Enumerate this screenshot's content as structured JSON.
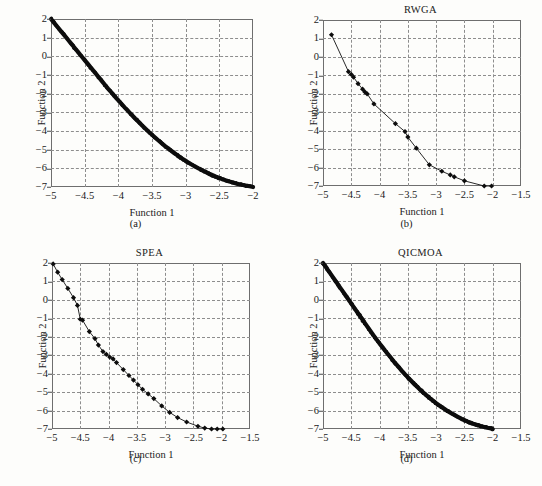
{
  "figure": {
    "panel_count": 4,
    "axis_label_x": "Function 1",
    "axis_label_y": "Function 2"
  },
  "chart_data": [
    {
      "type": "scatter",
      "panel": "a",
      "caption": "(a)",
      "title": "",
      "xlabel": "Function 1",
      "ylabel": "Function 2",
      "xlim": [
        -5,
        -2
      ],
      "ylim": [
        -7,
        2
      ],
      "xticks": [
        -5,
        -4.5,
        -4,
        -3.5,
        -3,
        -2.5,
        -2
      ],
      "xticklabels": [
        "−5",
        "−4.5",
        "−4",
        "−3.5",
        "−3",
        "−2.5",
        "−2"
      ],
      "yticks": [
        2,
        1,
        0,
        -1,
        -2,
        -3,
        -4,
        -5,
        -6,
        -7
      ],
      "yticklabels": [
        "2",
        "1",
        "0",
        "−1",
        "−2",
        "−3",
        "−4",
        "−5",
        "−6",
        "−7"
      ],
      "grid": true,
      "marker": "dense-dot-band",
      "legend": null,
      "x": [
        -5.0,
        -4.95,
        -4.9,
        -4.85,
        -4.8,
        -4.75,
        -4.7,
        -4.65,
        -4.6,
        -4.55,
        -4.5,
        -4.45,
        -4.4,
        -4.35,
        -4.3,
        -4.25,
        -4.2,
        -4.15,
        -4.1,
        -4.05,
        -4.0,
        -3.95,
        -3.9,
        -3.85,
        -3.8,
        -3.75,
        -3.7,
        -3.65,
        -3.6,
        -3.55,
        -3.5,
        -3.45,
        -3.4,
        -3.35,
        -3.3,
        -3.25,
        -3.2,
        -3.15,
        -3.1,
        -3.05,
        -3.0,
        -2.95,
        -2.9,
        -2.85,
        -2.8,
        -2.75,
        -2.7,
        -2.65,
        -2.6,
        -2.55,
        -2.5,
        -2.45,
        -2.4,
        -2.35,
        -2.3,
        -2.25,
        -2.2,
        -2.15,
        -2.1,
        -2.05,
        -2.0
      ],
      "y": [
        2.0,
        1.78,
        1.56,
        1.34,
        1.12,
        0.9,
        0.68,
        0.46,
        0.24,
        0.02,
        -0.2,
        -0.42,
        -0.64,
        -0.86,
        -1.08,
        -1.3,
        -1.52,
        -1.74,
        -1.95,
        -2.16,
        -2.36,
        -2.56,
        -2.76,
        -2.95,
        -3.14,
        -3.33,
        -3.51,
        -3.69,
        -3.87,
        -4.04,
        -4.2,
        -4.36,
        -4.52,
        -4.67,
        -4.82,
        -4.96,
        -5.1,
        -5.23,
        -5.36,
        -5.48,
        -5.6,
        -5.71,
        -5.82,
        -5.92,
        -6.02,
        -6.11,
        -6.2,
        -6.29,
        -6.37,
        -6.45,
        -6.52,
        -6.59,
        -6.65,
        -6.71,
        -6.76,
        -6.81,
        -6.85,
        -6.89,
        -6.93,
        -6.96,
        -7.0
      ]
    },
    {
      "type": "scatter",
      "panel": "b",
      "caption": "(b)",
      "title": "RWGA",
      "xlabel": "Function 1",
      "ylabel": "Function 2",
      "xlim": [
        -5,
        -1.5
      ],
      "ylim": [
        -7,
        2
      ],
      "xticks": [
        -5,
        -4.5,
        -4,
        -3.5,
        -3,
        -2.5,
        -2,
        -1.5
      ],
      "xticklabels": [
        "−5",
        "−4.5",
        "−4",
        "−3.5",
        "−3",
        "−2.5",
        "−2",
        "−1.5"
      ],
      "yticks": [
        2,
        1,
        0,
        -1,
        -2,
        -3,
        -4,
        -5,
        -6,
        -7
      ],
      "yticklabels": [
        "2",
        "1",
        "0",
        "−1",
        "−2",
        "−3",
        "−4",
        "−5",
        "−6",
        "−7"
      ],
      "grid": true,
      "marker": "diamond",
      "legend": null,
      "x": [
        -4.85,
        -4.55,
        -4.5,
        -4.46,
        -4.38,
        -4.3,
        -4.26,
        -4.22,
        -4.1,
        -3.72,
        -3.55,
        -3.5,
        -3.35,
        -3.12,
        -2.9,
        -2.75,
        -2.68,
        -2.5,
        -2.15,
        -2.02
      ],
      "y": [
        1.2,
        -0.8,
        -0.95,
        -1.1,
        -1.45,
        -1.75,
        -1.9,
        -2.0,
        -2.55,
        -3.62,
        -4.05,
        -4.35,
        -4.95,
        -5.85,
        -6.2,
        -6.4,
        -6.5,
        -6.72,
        -7.0,
        -7.0
      ]
    },
    {
      "type": "scatter",
      "panel": "c",
      "caption": "(c)",
      "title": "SPEA",
      "xlabel": "Function 1",
      "ylabel": "Function 2",
      "xlim": [
        -5,
        -1.5
      ],
      "ylim": [
        -7,
        2
      ],
      "xticks": [
        -5,
        -4.5,
        -4,
        -3.5,
        -3,
        -2.5,
        -2,
        -1.5
      ],
      "xticklabels": [
        "−5",
        "−4.5",
        "−4",
        "−3.5",
        "−3",
        "−2.5",
        "−2",
        "−1.5"
      ],
      "yticks": [
        2,
        1,
        0,
        -1,
        -2,
        -3,
        -4,
        -5,
        -6,
        -7
      ],
      "yticklabels": [
        "2",
        "1",
        "0",
        "−1",
        "−2",
        "−3",
        "−4",
        "−5",
        "−6",
        "−7"
      ],
      "grid": true,
      "marker": "diamond",
      "legend": null,
      "x": [
        -4.98,
        -4.9,
        -4.82,
        -4.72,
        -4.62,
        -4.55,
        -4.5,
        -4.46,
        -4.34,
        -4.24,
        -4.18,
        -4.1,
        -4.04,
        -3.98,
        -3.92,
        -3.86,
        -3.74,
        -3.64,
        -3.56,
        -3.48,
        -3.4,
        -3.3,
        -3.2,
        -3.06,
        -2.92,
        -2.78,
        -2.62,
        -2.42,
        -2.3,
        -2.18,
        -2.08,
        -1.98
      ],
      "y": [
        1.95,
        1.5,
        1.1,
        0.62,
        0.12,
        -0.3,
        -1.05,
        -1.1,
        -1.72,
        -2.1,
        -2.45,
        -2.8,
        -2.95,
        -3.1,
        -3.2,
        -3.4,
        -3.78,
        -4.1,
        -4.35,
        -4.6,
        -4.85,
        -5.1,
        -5.35,
        -5.75,
        -6.1,
        -6.38,
        -6.62,
        -6.85,
        -6.95,
        -7.0,
        -7.0,
        -7.0
      ]
    },
    {
      "type": "scatter",
      "panel": "d",
      "caption": "(d)",
      "title": "QICMOA",
      "xlabel": "Function 1",
      "ylabel": "Function 2",
      "xlim": [
        -5,
        -1.5
      ],
      "ylim": [
        -7,
        2
      ],
      "xticks": [
        -5,
        -4.5,
        -4,
        -3.5,
        -3,
        -2.5,
        -2,
        -1.5
      ],
      "xticklabels": [
        "−5",
        "−4.5",
        "−4",
        "−3.5",
        "−3",
        "−2.5",
        "−2",
        "−1.5"
      ],
      "yticks": [
        2,
        1,
        0,
        -1,
        -2,
        -3,
        -4,
        -5,
        -6,
        -7
      ],
      "yticklabels": [
        "2",
        "1",
        "0",
        "−1",
        "−2",
        "−3",
        "−4",
        "−5",
        "−6",
        "−7"
      ],
      "grid": true,
      "marker": "dense-dot-band",
      "legend": null,
      "x": [
        -5.0,
        -4.95,
        -4.9,
        -4.85,
        -4.8,
        -4.75,
        -4.7,
        -4.65,
        -4.6,
        -4.55,
        -4.5,
        -4.45,
        -4.4,
        -4.35,
        -4.3,
        -4.25,
        -4.2,
        -4.15,
        -4.1,
        -4.05,
        -4.0,
        -3.95,
        -3.9,
        -3.85,
        -3.8,
        -3.75,
        -3.7,
        -3.65,
        -3.6,
        -3.55,
        -3.5,
        -3.45,
        -3.4,
        -3.35,
        -3.3,
        -3.25,
        -3.2,
        -3.15,
        -3.1,
        -3.05,
        -3.0,
        -2.95,
        -2.9,
        -2.85,
        -2.8,
        -2.75,
        -2.7,
        -2.65,
        -2.6,
        -2.55,
        -2.5,
        -2.45,
        -2.4,
        -2.35,
        -2.3,
        -2.25,
        -2.2,
        -2.15,
        -2.1,
        -2.05,
        -2.0
      ],
      "y": [
        2.0,
        1.78,
        1.56,
        1.34,
        1.12,
        0.9,
        0.68,
        0.46,
        0.24,
        0.02,
        -0.2,
        -0.42,
        -0.64,
        -0.86,
        -1.08,
        -1.3,
        -1.52,
        -1.74,
        -1.95,
        -2.16,
        -2.36,
        -2.56,
        -2.76,
        -2.95,
        -3.14,
        -3.33,
        -3.51,
        -3.69,
        -3.87,
        -4.04,
        -4.2,
        -4.36,
        -4.52,
        -4.67,
        -4.82,
        -4.96,
        -5.1,
        -5.23,
        -5.36,
        -5.48,
        -5.6,
        -5.71,
        -5.82,
        -5.92,
        -6.02,
        -6.11,
        -6.2,
        -6.29,
        -6.37,
        -6.45,
        -6.52,
        -6.59,
        -6.65,
        -6.71,
        -6.76,
        -6.81,
        -6.85,
        -6.89,
        -6.93,
        -6.96,
        -7.0
      ]
    }
  ]
}
